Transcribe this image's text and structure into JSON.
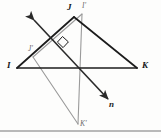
{
  "figure": {
    "width": 161,
    "height": 138,
    "background_color": "#fdfdfc",
    "preimage_color": "#1c1c1c",
    "image_color": "#9a9a9a",
    "axis_line_color": "#2a2a2a",
    "baseline_color": "#777777"
  },
  "labels": {
    "I": "I",
    "J": "J",
    "K": "K",
    "I_prime": "I'",
    "J_prime": "J'",
    "K_prime": "K'",
    "line_n": "n"
  },
  "points": {
    "I": {
      "x": 17,
      "y": 68
    },
    "J": {
      "x": 74,
      "y": 17
    },
    "K": {
      "x": 137,
      "y": 68
    },
    "I_prime": {
      "x": 82,
      "y": 14
    },
    "J_prime": {
      "x": 33,
      "y": 57
    },
    "K_prime": {
      "x": 78,
      "y": 124
    }
  },
  "label_positions": {
    "I": {
      "x": 8,
      "y": 62
    },
    "J": {
      "x": 69,
      "y": 4
    },
    "K": {
      "x": 143,
      "y": 62
    },
    "I_prime": {
      "x": 83,
      "y": 2
    },
    "J_prime": {
      "x": 28,
      "y": 45
    },
    "K_prime": {
      "x": 80,
      "y": 122
    },
    "n": {
      "x": 110,
      "y": 104
    }
  },
  "line_n": {
    "name": "n",
    "from": {
      "x": 34,
      "y": 20
    },
    "to": {
      "x": 108,
      "y": 99
    },
    "arrow_start": true,
    "arrow_end": true,
    "description": "line of reflection with arrowheads at both ends"
  },
  "right_angle_marker": {
    "x": 63,
    "y": 41,
    "size": 7,
    "description": "square marker showing perpendicularity at intersection"
  },
  "segments": [
    {
      "name": "IJ",
      "kind": "preimage",
      "from": "I",
      "to": "J"
    },
    {
      "name": "JK",
      "kind": "preimage",
      "from": "J",
      "to": "K"
    },
    {
      "name": "IK",
      "kind": "preimage",
      "from": "I",
      "to": "K"
    },
    {
      "name": "I'J'",
      "kind": "image",
      "from": "I_prime",
      "to": "J_prime"
    },
    {
      "name": "J'K'",
      "kind": "image",
      "from": "J_prime",
      "to": "K_prime"
    },
    {
      "name": "I'K'",
      "kind": "image",
      "from": "I_prime",
      "to": "K_prime"
    }
  ],
  "baseline": {
    "y": 131,
    "from_x": 0,
    "to_x": 161,
    "description": "horizontal rule across bottom of figure"
  }
}
